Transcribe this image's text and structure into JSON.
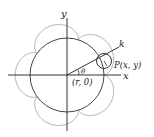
{
  "diagram": {
    "labels": {
      "y_axis": "y",
      "x_axis": "x",
      "k": "k",
      "point": "P(x, y)",
      "angle": "θ",
      "start_point": "(r, 0)"
    },
    "curve": {
      "type": "epicycloid",
      "cusps": 5
    },
    "colors": {
      "axes": "#333333",
      "circle": "#444444",
      "curve": "#aaaaaa",
      "small_circle": "#333333"
    }
  }
}
